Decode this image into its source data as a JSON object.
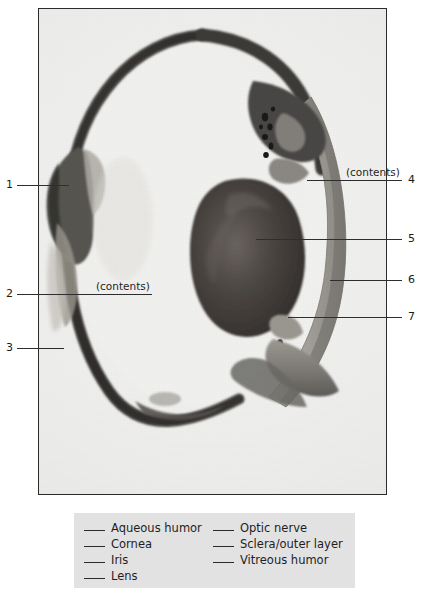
{
  "figure": {
    "type": "labeled-photograph",
    "palette": {
      "page_background": "#ffffff",
      "photo_background": "#efefed",
      "photo_border": "#2b2b2b",
      "sclera_dark": "#3b3a38",
      "lens_dark": "#3a3634",
      "tissue_mid": "#8d8b86",
      "tissue_light": "#b5b3ad",
      "legend_background": "#e2e2e2",
      "ink": "#1a1a1a"
    }
  },
  "callouts": [
    {
      "id": "1",
      "number": "1",
      "side": "left",
      "number_x": 6,
      "number_y": 179,
      "line_x": 17,
      "line_y": 185,
      "line_w": 52,
      "note": ""
    },
    {
      "id": "2",
      "number": "2",
      "side": "left",
      "number_x": 6,
      "number_y": 288,
      "line_x": 17,
      "line_y": 294,
      "line_w": 135,
      "note": "(contents)",
      "note_x": 96,
      "note_y": 281
    },
    {
      "id": "3",
      "number": "3",
      "side": "left",
      "number_x": 6,
      "number_y": 342,
      "line_x": 17,
      "line_y": 348,
      "line_w": 47,
      "note": ""
    },
    {
      "id": "4",
      "number": "4",
      "side": "right",
      "number_x": 408,
      "number_y": 174,
      "line_x": 307,
      "line_y": 180,
      "line_w": 95,
      "note": "(contents)",
      "note_x": 346,
      "note_y": 167
    },
    {
      "id": "5",
      "number": "5",
      "side": "right",
      "number_x": 408,
      "number_y": 233,
      "line_x": 256,
      "line_y": 239,
      "line_w": 146,
      "note": ""
    },
    {
      "id": "6",
      "number": "6",
      "side": "right",
      "number_x": 408,
      "number_y": 274,
      "line_x": 330,
      "line_y": 280,
      "line_w": 72,
      "note": ""
    },
    {
      "id": "7",
      "number": "7",
      "side": "right",
      "number_x": 408,
      "number_y": 311,
      "line_x": 288,
      "line_y": 317,
      "line_w": 114,
      "note": ""
    }
  ],
  "legend": {
    "left_column": [
      {
        "blank": "",
        "label": "Aqueous humor"
      },
      {
        "blank": "",
        "label": "Cornea"
      },
      {
        "blank": "",
        "label": "Iris"
      },
      {
        "blank": "",
        "label": "Lens"
      }
    ],
    "right_column": [
      {
        "blank": "",
        "label": "Optic nerve"
      },
      {
        "blank": "",
        "label": "Sclera/outer layer"
      },
      {
        "blank": "",
        "label": "Vitreous humor"
      }
    ]
  }
}
